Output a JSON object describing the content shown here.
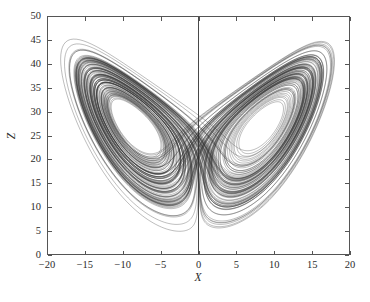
{
  "chart_data": {
    "type": "line",
    "title": "",
    "xlabel": "X",
    "ylabel": "Z",
    "xlim": [
      -20,
      20
    ],
    "ylim": [
      0,
      50
    ],
    "xticks": [
      -20,
      -15,
      -10,
      -5,
      0,
      5,
      10,
      15,
      20
    ],
    "yticks": [
      0,
      5,
      10,
      15,
      20,
      25,
      30,
      35,
      40,
      45,
      50
    ],
    "xtick_labels": [
      "-20",
      "-15",
      "-10",
      "-5",
      "0",
      "5",
      "10",
      "15",
      "20"
    ],
    "ytick_labels": [
      "0",
      "5",
      "10",
      "15",
      "20",
      "25",
      "30",
      "35",
      "40",
      "45",
      "50"
    ],
    "grid": false,
    "legend": null,
    "series": [
      {
        "name": "Lorenz attractor trajectory (X-Z projection)",
        "color": "#333333",
        "system": "Lorenz",
        "parameters": {
          "sigma": 10,
          "rho": 28,
          "beta": 2.6666666667
        },
        "initial_conditions": {
          "x": 1.0,
          "y": 1.0,
          "z": 20.0
        },
        "integration": {
          "dt": 0.0045,
          "steps": 32000,
          "method": "rk4"
        }
      }
    ],
    "annotations": [
      {
        "name": "x-zero-line",
        "type": "vline",
        "x": 0,
        "color": "#333333"
      }
    ]
  },
  "axes": {
    "x_title": "X",
    "z_title": "Z"
  }
}
